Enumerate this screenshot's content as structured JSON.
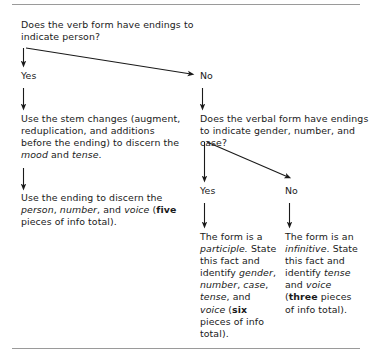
{
  "figure": {
    "type": "flowchart",
    "title": "",
    "background_color": "#ffffff",
    "text_color": "#1a1a1a",
    "rule_color": "#9a9a9a"
  },
  "rules": {
    "top_label": "top-divider-rule",
    "bottom_label": "bottom-divider-rule"
  },
  "nodes": {
    "question_1": "Does the verb form have endings to indicate person?",
    "label_yes_1": "Yes",
    "label_no_1": "No",
    "body_1": "Use the stem changes (augment, reduplication, and additions before the ending) to discern the mood and tense.",
    "body_2": "Use the ending to discern the person, number, and voice (five pieces of info total).",
    "question_2": "Does the verbal form have endings to indicate gender, number, and case?",
    "label_yes_2": "Yes",
    "label_no_2": "No",
    "body_3": "The form is a participle. State this fact and identify gender, number, case, tense, and voice (six pieces of info total).",
    "body_4": "The form is an infinitive. State this fact and identify tense and voice (three pieces of info total)."
  },
  "emphasis": {
    "body_1_italic": [
      "mood",
      "tense"
    ],
    "body_2_italic": [
      "person",
      "number",
      "voice"
    ],
    "body_2_bold": [
      "five"
    ],
    "body_3_italic": [
      "participle",
      "gender",
      "number",
      "case",
      "tense",
      "voice"
    ],
    "body_3_bold": [
      "six"
    ],
    "body_4_italic": [
      "infinitive",
      "tense",
      "voice"
    ],
    "body_4_bold": [
      "three"
    ]
  },
  "edges": [
    {
      "name": "q1-to-yes1",
      "from": "question_1",
      "to": "label_yes_1",
      "kind": "vertical"
    },
    {
      "name": "q1-to-no1",
      "from": "question_1",
      "to": "label_no_1",
      "kind": "diagonal"
    },
    {
      "name": "yes1-to-body1",
      "from": "label_yes_1",
      "to": "body_1",
      "kind": "vertical"
    },
    {
      "name": "body1-to-body2",
      "from": "body_1",
      "to": "body_2",
      "kind": "vertical"
    },
    {
      "name": "no1-to-q2",
      "from": "label_no_1",
      "to": "question_2",
      "kind": "vertical"
    },
    {
      "name": "q2-to-yes2",
      "from": "question_2",
      "to": "label_yes_2",
      "kind": "vertical"
    },
    {
      "name": "q2-to-no2",
      "from": "question_2",
      "to": "label_no_2",
      "kind": "diagonal"
    },
    {
      "name": "yes2-to-body3",
      "from": "label_yes_2",
      "to": "body_3",
      "kind": "vertical"
    },
    {
      "name": "no2-to-body4",
      "from": "label_no_2",
      "to": "body_4",
      "kind": "vertical"
    }
  ]
}
